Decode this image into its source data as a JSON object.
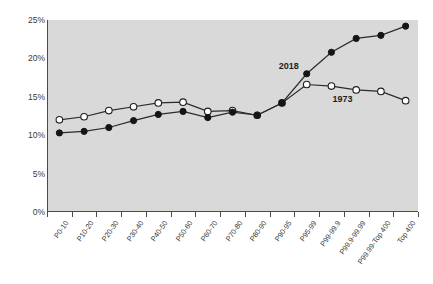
{
  "chart_data": {
    "type": "line",
    "title": "",
    "xlabel": "",
    "ylabel": "",
    "ylim": [
      0,
      25
    ],
    "ytick_values": [
      0,
      5,
      10,
      15,
      20,
      25
    ],
    "ytick_labels": [
      "0%",
      "5%",
      "10%",
      "15%",
      "20%",
      "25%"
    ],
    "grid": false,
    "legend_position": "inline-annotations",
    "categories": [
      "P0-10",
      "P10-20",
      "P20-30",
      "P30-40",
      "P40-50",
      "P50-60",
      "P60-70",
      "P70-80",
      "P80-90",
      "P90-95",
      "P95-99",
      "P99-99.9",
      "P99.9-99.99",
      "P99.99-Top 400",
      "Top 400"
    ],
    "series": [
      {
        "name": "1973",
        "marker": "open-circle",
        "marker_fill": "#ffffff",
        "line_color": "#2b2b2b",
        "annotation": "1973",
        "values": [
          12.0,
          12.4,
          13.2,
          13.7,
          14.2,
          14.3,
          13.1,
          13.2,
          12.6,
          14.2,
          16.6,
          16.4,
          15.9,
          15.7,
          14.5
        ]
      },
      {
        "name": "2018",
        "marker": "filled-circle",
        "marker_fill": "#151515",
        "line_color": "#2b2b2b",
        "annotation": "2018",
        "values": [
          10.3,
          10.5,
          11.0,
          11.9,
          12.7,
          13.1,
          12.3,
          13.0,
          12.6,
          14.2,
          18.0,
          20.8,
          22.6,
          23.0,
          24.2
        ]
      }
    ]
  },
  "annotations": {
    "series_2018_label": "2018",
    "series_1973_label": "1973"
  },
  "colors": {
    "plot_background": "#d9d9d9",
    "axis": "#4a4a4a",
    "line": "#2b2b2b",
    "marker_filled": "#151515",
    "marker_open": "#ffffff",
    "page_background": "#ffffff"
  }
}
